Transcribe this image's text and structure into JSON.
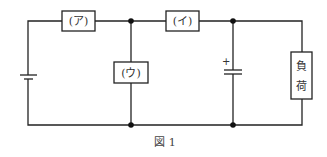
{
  "figure": {
    "caption": "図 1",
    "components": {
      "box_a": {
        "label": "(ア)"
      },
      "box_i": {
        "label": "(イ)"
      },
      "box_u": {
        "label": "(ウ)"
      },
      "load": {
        "label_line1": "負",
        "label_line2": "荷"
      },
      "capacitor": {
        "polarity_mark": "+"
      },
      "battery": {
        "type": "dc-source"
      }
    },
    "colors": {
      "line": "#222222",
      "background": "#ffffff"
    }
  }
}
